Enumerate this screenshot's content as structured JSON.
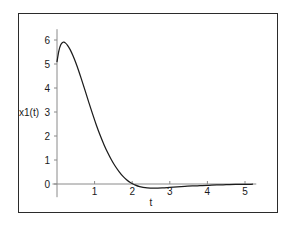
{
  "figure": {
    "border_color": "#2b2b2b",
    "background": "#ffffff",
    "curve_color": "#1c1c1c",
    "axis_color": "#8a8a8a"
  },
  "chart_data": {
    "type": "line",
    "title": "",
    "subtitle": "",
    "xlabel": "t",
    "ylabel": "x1(t)",
    "xlim": [
      -0.12,
      5.3
    ],
    "ylim": [
      -0.55,
      6.45
    ],
    "grid": false,
    "legend": null,
    "xticks": [
      1,
      2,
      3,
      4,
      5
    ],
    "xtick_labels": [
      "1",
      "2",
      "3",
      "4",
      "5"
    ],
    "yticks": [
      0,
      1,
      2,
      3,
      4,
      5,
      6
    ],
    "ytick_labels": [
      "0",
      "1",
      "2",
      "3",
      "4",
      "5",
      "6"
    ],
    "annotations": [],
    "series": [
      {
        "name": "x1(t)",
        "color": "#1c1c1c",
        "x": [
          0.0,
          0.05,
          0.1,
          0.15,
          0.18,
          0.22,
          0.28,
          0.35,
          0.42,
          0.5,
          0.58,
          0.66,
          0.75,
          0.85,
          0.95,
          1.05,
          1.15,
          1.25,
          1.35,
          1.45,
          1.55,
          1.65,
          1.75,
          1.85,
          1.95,
          2.05,
          2.2,
          2.4,
          2.6,
          2.8,
          3.0,
          3.2,
          3.4,
          3.6,
          3.8,
          4.0,
          4.25,
          4.5,
          4.75,
          5.0,
          5.2
        ],
        "y": [
          5.1,
          5.55,
          5.8,
          5.9,
          5.91,
          5.88,
          5.78,
          5.6,
          5.36,
          5.05,
          4.7,
          4.32,
          3.88,
          3.38,
          2.9,
          2.44,
          2.02,
          1.64,
          1.3,
          1.0,
          0.74,
          0.52,
          0.33,
          0.18,
          0.06,
          -0.02,
          -0.11,
          -0.16,
          -0.17,
          -0.16,
          -0.14,
          -0.12,
          -0.1,
          -0.08,
          -0.07,
          -0.06,
          -0.04,
          -0.03,
          -0.02,
          -0.02,
          -0.01
        ]
      }
    ]
  }
}
